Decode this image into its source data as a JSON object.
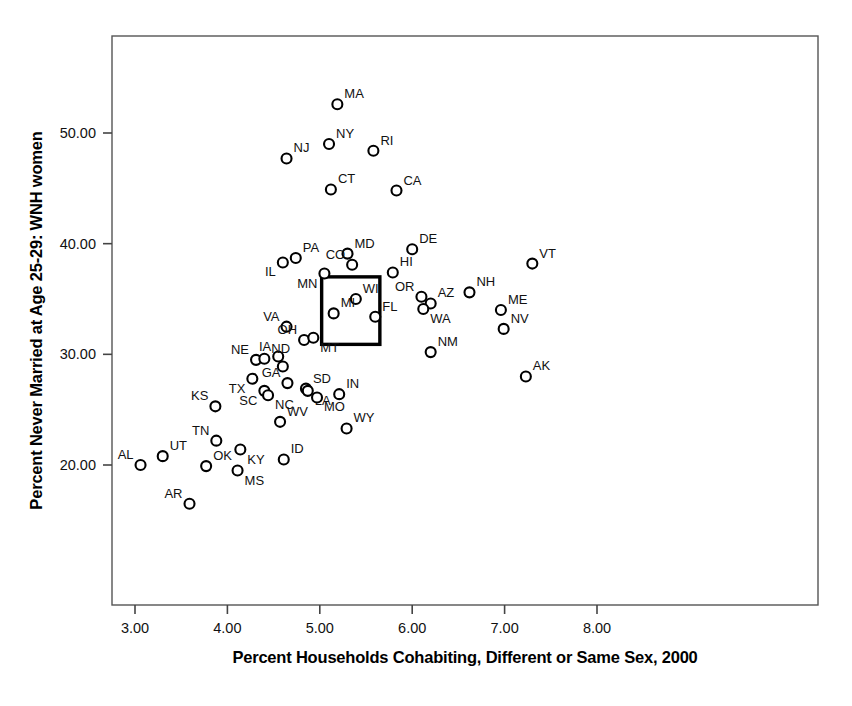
{
  "chart_data": {
    "type": "scatter",
    "title": "",
    "xlabel": "Percent Households Cohabiting, Different or Same Sex, 2000",
    "ylabel": "Percent Never Married at Age 25-29: WNH women",
    "xlim": [
      2.75,
      8.25
    ],
    "ylim": [
      15.0,
      57.0
    ],
    "xticks": [
      "3.00",
      "4.00",
      "5.00",
      "6.00",
      "7.00",
      "8.00"
    ],
    "xtick_values": [
      3.0,
      4.0,
      5.0,
      6.0,
      7.0,
      8.0
    ],
    "yticks": [
      "20.00",
      "30.00",
      "40.00",
      "50.00"
    ],
    "ytick_values": [
      20.0,
      30.0,
      40.0,
      50.0
    ],
    "grid": false,
    "legend": null,
    "marker": "open-circle",
    "points": [
      {
        "label": "MA",
        "x": 5.19,
        "y": 52.6,
        "lpos": "ne"
      },
      {
        "label": "NY",
        "x": 5.1,
        "y": 49.0,
        "lpos": "ne"
      },
      {
        "label": "RI",
        "x": 5.58,
        "y": 48.4,
        "lpos": "ne"
      },
      {
        "label": "NJ",
        "x": 4.64,
        "y": 47.7,
        "lpos": "ne"
      },
      {
        "label": "CT",
        "x": 5.12,
        "y": 44.9,
        "lpos": "ne"
      },
      {
        "label": "CA",
        "x": 5.83,
        "y": 44.8,
        "lpos": "ne"
      },
      {
        "label": "DE",
        "x": 6.0,
        "y": 39.5,
        "lpos": "ne"
      },
      {
        "label": "MD",
        "x": 5.3,
        "y": 39.1,
        "lpos": "ne"
      },
      {
        "label": "PA",
        "x": 4.74,
        "y": 38.7,
        "lpos": "ne"
      },
      {
        "label": "IL",
        "x": 4.6,
        "y": 38.3,
        "lpos": "sw"
      },
      {
        "label": "VT",
        "x": 7.3,
        "y": 38.2,
        "lpos": "ne"
      },
      {
        "label": "CO",
        "x": 5.35,
        "y": 38.1,
        "lpos": "nw"
      },
      {
        "label": "HI",
        "x": 5.79,
        "y": 37.4,
        "lpos": "ne"
      },
      {
        "label": "MN",
        "x": 5.05,
        "y": 37.3,
        "lpos": "sw"
      },
      {
        "label": "NH",
        "x": 6.62,
        "y": 35.6,
        "lpos": "ne"
      },
      {
        "label": "OR",
        "x": 6.1,
        "y": 35.2,
        "lpos": "nw"
      },
      {
        "label": "WI",
        "x": 5.39,
        "y": 35.0,
        "lpos": "ne"
      },
      {
        "label": "AZ",
        "x": 6.2,
        "y": 34.6,
        "lpos": "ne"
      },
      {
        "label": "ME",
        "x": 6.96,
        "y": 34.0,
        "lpos": "ne"
      },
      {
        "label": "MI",
        "x": 5.15,
        "y": 33.7,
        "lpos": "ne"
      },
      {
        "label": "WA",
        "x": 6.12,
        "y": 34.1,
        "lpos": "se"
      },
      {
        "label": "FL",
        "x": 5.6,
        "y": 33.4,
        "lpos": "ne"
      },
      {
        "label": "VA",
        "x": 4.64,
        "y": 32.5,
        "lpos": "nw"
      },
      {
        "label": "NV",
        "x": 6.99,
        "y": 32.3,
        "lpos": "ne"
      },
      {
        "label": "OH",
        "x": 4.83,
        "y": 31.3,
        "lpos": "nw"
      },
      {
        "label": "MT",
        "x": 4.93,
        "y": 31.5,
        "lpos": "se"
      },
      {
        "label": "NM",
        "x": 6.2,
        "y": 30.2,
        "lpos": "ne"
      },
      {
        "label": "IA",
        "x": 4.55,
        "y": 29.8,
        "lpos": "nw"
      },
      {
        "label": "NE",
        "x": 4.31,
        "y": 29.5,
        "lpos": "nw"
      },
      {
        "label": "ND",
        "x": 4.4,
        "y": 29.6,
        "lpos": "ne"
      },
      {
        "label": "IA2",
        "x": 4.6,
        "y": 28.9,
        "lpos": "none"
      },
      {
        "label": "AK",
        "x": 7.23,
        "y": 28.0,
        "lpos": "ne"
      },
      {
        "label": "GA",
        "x": 4.65,
        "y": 27.4,
        "lpos": "nw"
      },
      {
        "label": "TX",
        "x": 4.27,
        "y": 27.8,
        "lpos": "sw"
      },
      {
        "label": "SD",
        "x": 4.85,
        "y": 26.9,
        "lpos": "ne"
      },
      {
        "label": "LA",
        "x": 4.87,
        "y": 26.7,
        "lpos": "se"
      },
      {
        "label": "SC",
        "x": 4.4,
        "y": 26.7,
        "lpos": "sw"
      },
      {
        "label": "NC",
        "x": 4.44,
        "y": 26.3,
        "lpos": "se"
      },
      {
        "label": "IN",
        "x": 5.21,
        "y": 26.4,
        "lpos": "ne"
      },
      {
        "label": "MO",
        "x": 4.97,
        "y": 26.1,
        "lpos": "se"
      },
      {
        "label": "KS",
        "x": 3.87,
        "y": 25.3,
        "lpos": "nw"
      },
      {
        "label": "WV",
        "x": 4.57,
        "y": 23.9,
        "lpos": "ne"
      },
      {
        "label": "WY",
        "x": 5.29,
        "y": 23.3,
        "lpos": "ne"
      },
      {
        "label": "TN",
        "x": 3.88,
        "y": 22.2,
        "lpos": "nw"
      },
      {
        "label": "KY",
        "x": 4.14,
        "y": 21.4,
        "lpos": "se"
      },
      {
        "label": "UT",
        "x": 3.3,
        "y": 20.8,
        "lpos": "ne"
      },
      {
        "label": "ID",
        "x": 4.61,
        "y": 20.5,
        "lpos": "ne"
      },
      {
        "label": "AL",
        "x": 3.06,
        "y": 20.0,
        "lpos": "nw"
      },
      {
        "label": "OK",
        "x": 3.77,
        "y": 19.9,
        "lpos": "ne"
      },
      {
        "label": "MS",
        "x": 4.11,
        "y": 19.5,
        "lpos": "se"
      },
      {
        "label": "AR",
        "x": 3.59,
        "y": 16.5,
        "lpos": "nw"
      }
    ],
    "annotations": [
      {
        "name": "highlight-square",
        "type": "rect",
        "x0": 5.02,
        "x1": 5.65,
        "y0": 30.9,
        "y1": 37.0,
        "note": "black square outlining Michigan region"
      }
    ]
  }
}
